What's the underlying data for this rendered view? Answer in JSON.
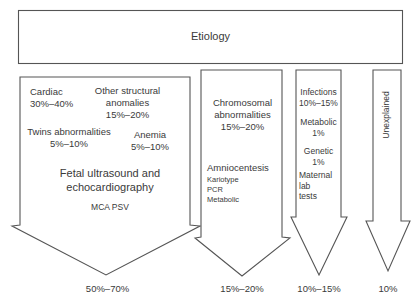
{
  "title": "Etiology",
  "columns": [
    {
      "id": "structural",
      "items": [
        {
          "name": "Cardiac",
          "value": "30%–40%"
        },
        {
          "name": "Other structural anomalies",
          "name_lines": [
            "Other structural",
            "anomalies"
          ],
          "value": "15%–20%"
        },
        {
          "name": "Twins abnormalities",
          "value": "5%–10%"
        },
        {
          "name": "Anemia",
          "value": "5%–10%"
        }
      ],
      "test_lines": [
        "Fetal ultrasound and",
        "echocardiography"
      ],
      "subtests": [
        "MCA PSV"
      ],
      "total": "50%–70%"
    },
    {
      "id": "chromosomal",
      "items": [
        {
          "name": "Chromosomal abnormalities",
          "name_lines": [
            "Chromosomal",
            "abnormalities"
          ],
          "value": "15%–20%"
        }
      ],
      "test": "Amniocentesis",
      "subtests": [
        "Kariotype",
        "PCR",
        "Metabolic"
      ],
      "total": "15%–20%"
    },
    {
      "id": "infectious-metabolic",
      "items": [
        {
          "name": "Infections",
          "value": "10%–15%"
        },
        {
          "name": "Metabolic",
          "value": "1%"
        },
        {
          "name": "Genetic",
          "value": "1%"
        }
      ],
      "test_lines": [
        "Maternal",
        "lab",
        "tests"
      ],
      "total": "10%–15%"
    },
    {
      "id": "unexplained",
      "label": "Unexplained",
      "total": "10%"
    }
  ],
  "colors": {
    "stroke": "#555555",
    "text": "#3a3a3a",
    "background": "#ffffff"
  }
}
